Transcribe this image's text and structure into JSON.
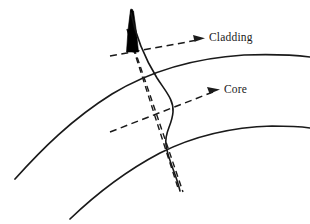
{
  "figure": {
    "type": "technical-line-diagram",
    "width": 310,
    "height": 224,
    "background_color": "#ffffff",
    "line_color": "#1a1a1a",
    "probe_color": "#000000"
  },
  "labels": {
    "cladding": "Cladding",
    "core": "Core"
  },
  "annotations": [
    {
      "name": "cladding-callout",
      "label": "Cladding",
      "arrow": "dashed-arrow-right",
      "arrow_from": [
        110,
        56
      ],
      "arrow_to": [
        203,
        39
      ],
      "label_position": [
        209,
        32
      ]
    },
    {
      "name": "core-callout",
      "label": "Core",
      "arrow": "dashed-arrow-right",
      "arrow_from": [
        110,
        132
      ],
      "arrow_to": [
        218,
        91
      ],
      "label_position": [
        224,
        84
      ]
    }
  ],
  "geometry": {
    "cladding_outer_arc": {
      "name": "cladding-outer-boundary",
      "style": "solid",
      "points": [
        [
          15,
          178
        ],
        [
          70,
          118
        ],
        [
          150,
          70
        ],
        [
          230,
          56
        ],
        [
          310,
          58
        ]
      ]
    },
    "core_upper_arc": {
      "name": "core-upper-boundary",
      "style": "solid",
      "points": [
        [
          70,
          218
        ],
        [
          130,
          170
        ],
        [
          200,
          138
        ],
        [
          260,
          127
        ],
        [
          310,
          128
        ]
      ]
    },
    "probe_shaft": {
      "name": "probe-tapered-tip",
      "style": "filled-wedge",
      "tip": [
        131,
        10
      ],
      "base_left": [
        125,
        53
      ],
      "base_right": [
        138,
        53
      ]
    },
    "deflection_curve": {
      "name": "s-shaped-fiber-deflection",
      "style": "solid",
      "points": [
        [
          131,
          12
        ],
        [
          145,
          60
        ],
        [
          160,
          85
        ],
        [
          172,
          105
        ],
        [
          168,
          135
        ],
        [
          176,
          165
        ],
        [
          180,
          190
        ]
      ]
    },
    "probe_axis_dashed": {
      "name": "probe-center-axis",
      "style": "dashed",
      "from": [
        128,
        30
      ],
      "to": [
        178,
        188
      ]
    },
    "probe_trailing_dashed": {
      "name": "probe-trailing-line",
      "style": "dashed",
      "from": [
        136,
        52
      ],
      "to": [
        182,
        190
      ]
    }
  }
}
